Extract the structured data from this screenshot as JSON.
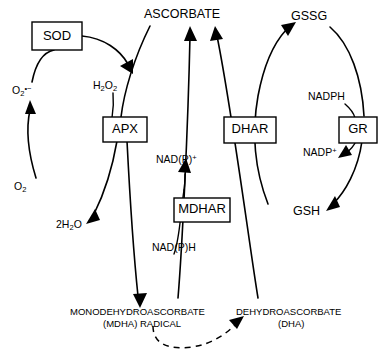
{
  "diagram": {
    "type": "biochemical-pathway",
    "enzymes": [
      {
        "id": "sod",
        "label": "SOD",
        "name": "superoxide dismutase"
      },
      {
        "id": "apx",
        "label": "APX",
        "name": "ascorbate peroxidase"
      },
      {
        "id": "mdhar",
        "label": "MDHAR",
        "name": "monodehydroascorbate reductase"
      },
      {
        "id": "dhar",
        "label": "DHAR",
        "name": "dehydroascorbate reductase"
      },
      {
        "id": "gr",
        "label": "GR",
        "name": "glutathione reductase"
      }
    ],
    "metabolites": [
      {
        "id": "o2",
        "base": "O",
        "sub": "2",
        "sup": ""
      },
      {
        "id": "superoxide",
        "base": "O",
        "sub": "2",
        "sup": "•−"
      },
      {
        "id": "h2o2",
        "base": "H",
        "sub": "2",
        "base2": "O",
        "sub2": "2"
      },
      {
        "id": "water",
        "base": "2H",
        "sub": "2",
        "base2": "O"
      },
      {
        "id": "ascorbate",
        "label": "ASCORBATE"
      },
      {
        "id": "mdha",
        "label": "MONODEHYDROASCORBATE",
        "label2": "(MDHA) RADICAL"
      },
      {
        "id": "dha",
        "label": "DEHYDROASCORBATE",
        "label2": "(DHA)"
      },
      {
        "id": "gssg",
        "label": "GSSG"
      },
      {
        "id": "gsh",
        "label": "GSH"
      },
      {
        "id": "nadp_ox",
        "label": "NAD(P)",
        "sup": "+"
      },
      {
        "id": "nadp_red",
        "label": "NAD(P)H"
      },
      {
        "id": "nadph",
        "label": "NADPH"
      },
      {
        "id": "nadp_plus",
        "label": "NADP",
        "sup": "+"
      }
    ],
    "labels": {
      "ascorbate": "ASCORBATE",
      "mdha_line1": "MONODEHYDROASCORBATE",
      "mdha_line2": "(MDHA) RADICAL",
      "dha_line1": "DEHYDROASCORBATE",
      "dha_line2": "(DHA)",
      "gssg": "GSSG",
      "gsh": "GSH",
      "nadph": "NADPH",
      "nadp_plus": "NADP",
      "nadp_plus_sup": "+",
      "nadp_ox": "NAD(P)",
      "nadp_ox_sup": "+",
      "nadp_red": "NAD(P)H",
      "o2_base": "O",
      "o2_sub": "2",
      "superoxide_base": "O",
      "superoxide_sub": "2",
      "superoxide_sup": "•−",
      "h2o2_h": "H",
      "h2o2_sub1": "2",
      "h2o2_o": "O",
      "h2o2_sub2": "2",
      "water_pre": "2H",
      "water_sub": "2",
      "water_o": "O",
      "sod": "SOD",
      "apx": "APX",
      "mdhar": "MDHAR",
      "dhar": "DHAR",
      "gr": "GR"
    },
    "colors": {
      "stroke": "#000000",
      "background": "#ffffff",
      "box_fill": "#ffffff"
    }
  }
}
